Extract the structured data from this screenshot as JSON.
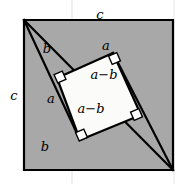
{
  "figure": {
    "colors": {
      "background": "#ffffff",
      "outer_square_fill": "#a8a8a8",
      "inner_square_fill": "#fbfbfa",
      "stroke": "#000000",
      "faint_guide": "#d9d9d9"
    },
    "outer_square": {
      "label_top": "c",
      "label_left": "c",
      "points": "24,20 173,20 173,170 24,170"
    },
    "inner_square": {
      "label_upper": "a−b",
      "label_lower": "a−b",
      "points": "57,78 113,53 141,115 80,140"
    },
    "triangle_legs": {
      "top_b": "b",
      "top_a": "a",
      "left_a": "a",
      "bottom_b": "b"
    },
    "labels": [
      {
        "name": "outer-top-c",
        "text": "c",
        "x": 100,
        "y": 14,
        "cls": "label-side"
      },
      {
        "name": "outer-left-c",
        "text": "c",
        "x": 14,
        "y": 95,
        "cls": "label-side"
      },
      {
        "name": "leg-top-b",
        "text": "b",
        "x": 47,
        "y": 48,
        "cls": "label-side"
      },
      {
        "name": "leg-top-a",
        "text": "a",
        "x": 106,
        "y": 45,
        "cls": "label-side"
      },
      {
        "name": "leg-left-a",
        "text": "a",
        "x": 51,
        "y": 98,
        "cls": "label-side"
      },
      {
        "name": "leg-bottom-b",
        "text": "b",
        "x": 45,
        "y": 146,
        "cls": "label-side"
      },
      {
        "name": "inner-side-upper",
        "text": "a−b",
        "x": 104,
        "y": 74,
        "cls": "label-inner"
      },
      {
        "name": "inner-side-lower",
        "text": "a−b",
        "x": 91,
        "y": 108,
        "cls": "label-inner"
      }
    ],
    "right_angle_markers": [
      {
        "name": "right-angle-left-vertex",
        "x": 57,
        "y": 78
      },
      {
        "name": "right-angle-top-vertex",
        "x": 113,
        "y": 53
      },
      {
        "name": "right-angle-right-vertex",
        "x": 141,
        "y": 115
      },
      {
        "name": "right-angle-bottom-vertex",
        "x": 80,
        "y": 140
      }
    ]
  }
}
